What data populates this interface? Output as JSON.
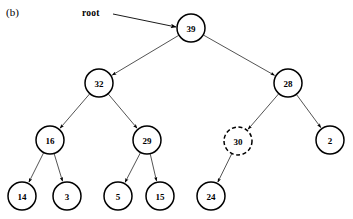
{
  "figure": {
    "panel_label": "(b)",
    "root_label": "root",
    "caption_text": ""
  },
  "colors": {
    "node_stroke": "#000000",
    "node_fill": "#ffffff",
    "edge_stroke": "#1a1a1a",
    "text": "#000000",
    "background": "#ffffff"
  },
  "chart_data": {
    "type": "diagram",
    "diagram_kind": "binary-tree",
    "title": "(b)",
    "root_pointer_label": "root",
    "nodes": [
      {
        "id": "n39",
        "label": "39",
        "cx": 191,
        "cy": 28,
        "r": 14,
        "style": "solid",
        "level": 0
      },
      {
        "id": "n32",
        "label": "32",
        "cx": 99,
        "cy": 83,
        "r": 14,
        "style": "solid",
        "level": 1
      },
      {
        "id": "n28",
        "label": "28",
        "cx": 288,
        "cy": 83,
        "r": 14,
        "style": "solid",
        "level": 1
      },
      {
        "id": "n16",
        "label": "16",
        "cx": 50,
        "cy": 140,
        "r": 14,
        "style": "solid",
        "level": 2
      },
      {
        "id": "n29",
        "label": "29",
        "cx": 147,
        "cy": 140,
        "r": 14,
        "style": "solid",
        "level": 2
      },
      {
        "id": "n30",
        "label": "30",
        "cx": 238,
        "cy": 141,
        "r": 14,
        "style": "dashed",
        "level": 2
      },
      {
        "id": "n2",
        "label": "2",
        "cx": 330,
        "cy": 140,
        "r": 14,
        "style": "solid",
        "level": 2
      },
      {
        "id": "n14",
        "label": "14",
        "cx": 22,
        "cy": 196,
        "r": 14,
        "style": "solid",
        "level": 3
      },
      {
        "id": "n3",
        "label": "3",
        "cx": 67,
        "cy": 196,
        "r": 14,
        "style": "solid",
        "level": 3
      },
      {
        "id": "n5",
        "label": "5",
        "cx": 118,
        "cy": 196,
        "r": 14,
        "style": "solid",
        "level": 3
      },
      {
        "id": "n15",
        "label": "15",
        "cx": 160,
        "cy": 196,
        "r": 14,
        "style": "solid",
        "level": 3
      },
      {
        "id": "n24",
        "label": "24",
        "cx": 211,
        "cy": 196,
        "r": 14,
        "style": "solid",
        "level": 3
      }
    ],
    "edges": [
      {
        "from": "n39",
        "to": "n32",
        "arrow": true,
        "side": "left"
      },
      {
        "from": "n39",
        "to": "n28",
        "arrow": true,
        "side": "right"
      },
      {
        "from": "n32",
        "to": "n16",
        "arrow": true,
        "side": "left"
      },
      {
        "from": "n32",
        "to": "n29",
        "arrow": true,
        "side": "right"
      },
      {
        "from": "n28",
        "to": "n30",
        "arrow": true,
        "side": "left"
      },
      {
        "from": "n28",
        "to": "n2",
        "arrow": true,
        "side": "right"
      },
      {
        "from": "n16",
        "to": "n14",
        "arrow": true,
        "side": "left"
      },
      {
        "from": "n16",
        "to": "n3",
        "arrow": true,
        "side": "right"
      },
      {
        "from": "n29",
        "to": "n5",
        "arrow": true,
        "side": "left"
      },
      {
        "from": "n29",
        "to": "n15",
        "arrow": true,
        "side": "right"
      },
      {
        "from": "n30",
        "to": "n24",
        "arrow": true,
        "side": "left"
      }
    ],
    "root_pointer": {
      "label": "root",
      "label_x": 82,
      "label_y": 14,
      "line_from": [
        113,
        14
      ],
      "line_to": [
        176,
        27
      ]
    },
    "panel_label_pos": {
      "x": 7,
      "y": 13
    }
  }
}
